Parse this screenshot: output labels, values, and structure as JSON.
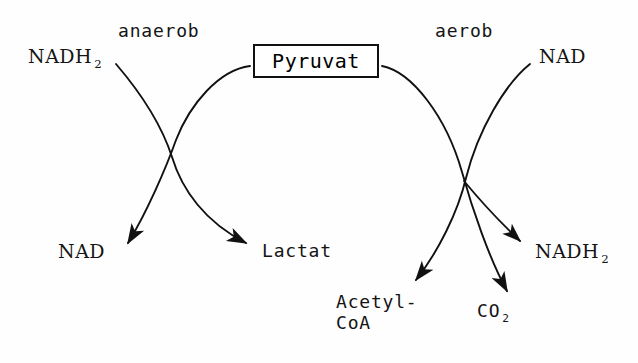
{
  "figure": {
    "kind": "biochemical-pathway-diagram",
    "title_text": "Pyruvat",
    "background_color": "#fefefe",
    "ink_color": "#141414"
  },
  "branches": {
    "anaerobic": {
      "label": "anaerob",
      "substrate_in": "NADH",
      "substrate_in_sub": "2",
      "products": [
        {
          "label": "NAD",
          "sub": ""
        },
        {
          "label": "Lactat",
          "sub": ""
        }
      ]
    },
    "aerobic": {
      "label": "aerob",
      "substrate_in": "NAD",
      "substrate_in_sub": "",
      "products": [
        {
          "label": "Acetyl-",
          "label_line2": "CoA",
          "sub": ""
        },
        {
          "label": "CO",
          "sub": "2"
        },
        {
          "label": "NADH",
          "sub": "2"
        }
      ]
    }
  },
  "labels": {
    "anaerob": "anaerob",
    "aerob": "aerob",
    "pyruvat": "Pyruvat",
    "nadh2_left": "NADH",
    "nadh2_left_sub": "2",
    "nad_right": "NAD",
    "nad_bottom_left": "NAD",
    "lactat": "Lactat",
    "acetyl_line1": "Acetyl-",
    "acetyl_line2": "CoA",
    "co2": "CO",
    "co2_sub": "2",
    "nadh2_bottom_right": "NADH",
    "nadh2_bottom_right_sub": "2"
  }
}
